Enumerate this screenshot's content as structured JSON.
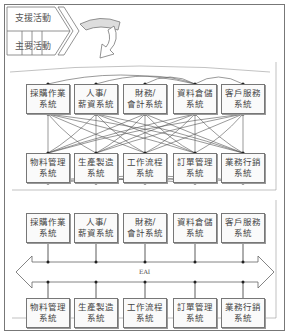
{
  "value_chain": {
    "support_label": "支援活動",
    "primary_label": "主要活動"
  },
  "panel_top": {
    "top_row": [
      {
        "line1": "採購作業",
        "line2": "系統"
      },
      {
        "line1": "人事/",
        "line2": "薪資系統"
      },
      {
        "line1": "財務/",
        "line2": "會計系統"
      },
      {
        "line1": "資料倉儲",
        "line2": "系統"
      },
      {
        "line1": "客戶服務",
        "line2": "系統"
      }
    ],
    "bottom_row": [
      {
        "line1": "物料管理",
        "line2": "系統"
      },
      {
        "line1": "生產製造",
        "line2": "系統"
      },
      {
        "line1": "工作流程",
        "line2": "系統"
      },
      {
        "line1": "訂單管理",
        "line2": "系統"
      },
      {
        "line1": "業務行銷",
        "line2": "系統"
      }
    ]
  },
  "panel_bottom": {
    "bus_label": "EAI",
    "top_row": [
      {
        "line1": "採購作業",
        "line2": "系統"
      },
      {
        "line1": "人事/",
        "line2": "薪資系統"
      },
      {
        "line1": "財務/",
        "line2": "會計系統"
      },
      {
        "line1": "資料倉儲",
        "line2": "系統"
      },
      {
        "line1": "客戶服務",
        "line2": "系統"
      }
    ],
    "bottom_row": [
      {
        "line1": "物料管理",
        "line2": "系統"
      },
      {
        "line1": "生產製造",
        "line2": "系統"
      },
      {
        "line1": "工作流程",
        "line2": "系統"
      },
      {
        "line1": "訂單管理",
        "line2": "系統"
      },
      {
        "line1": "業務行銷",
        "line2": "系統"
      }
    ]
  }
}
